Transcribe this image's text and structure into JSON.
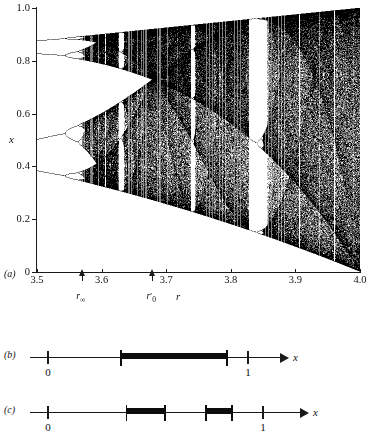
{
  "figure": {
    "panels": [
      {
        "tag": "(a)",
        "type": "bifurcation-diagram"
      },
      {
        "tag": "(b)",
        "type": "number-line"
      },
      {
        "tag": "(c)",
        "type": "number-line"
      }
    ]
  },
  "panel_a": {
    "tag": "(a)",
    "ylabel": "x",
    "xlabel": "r",
    "y_ticks": [
      "0",
      "0.2",
      "0.4",
      "0.6",
      "0.8",
      "1.0"
    ],
    "y_tick_values": [
      0,
      0.2,
      0.4,
      0.6,
      0.8,
      1.0
    ],
    "x_ticks": [
      "3.5",
      "3.6",
      "3.7",
      "3.8",
      "3.9",
      "4.0"
    ],
    "x_tick_values": [
      3.5,
      3.6,
      3.7,
      3.8,
      3.9,
      4.0
    ],
    "markers": [
      {
        "name": "r-infinity",
        "label_base": "r",
        "label_sub": "∞",
        "prime": false,
        "r": 3.5699
      },
      {
        "name": "r-zero-prime",
        "label_base": "r",
        "label_sub": "0",
        "prime": true,
        "r": 3.6786
      }
    ]
  },
  "panel_b": {
    "tag": "(b)",
    "axis_label": "x",
    "ticks": [
      {
        "label": "0",
        "value": 0.0
      },
      {
        "label": "1",
        "value": 1.0
      }
    ],
    "intervals": [
      {
        "start": 0.365,
        "end": 0.895
      }
    ]
  },
  "panel_c": {
    "tag": "(c)",
    "axis_label": "x",
    "ticks": [
      {
        "label": "0",
        "value": 0.0
      },
      {
        "label": "1",
        "value": 1.0
      }
    ],
    "intervals": [
      {
        "start": 0.365,
        "end": 0.545
      },
      {
        "start": 0.735,
        "end": 0.855
      }
    ]
  },
  "chart_data": {
    "type": "scatter",
    "title": "",
    "xlabel": "r",
    "ylabel": "x",
    "xlim": [
      3.5,
      4.0
    ],
    "ylim": [
      0.0,
      1.0
    ],
    "grid": false,
    "legend": "none",
    "map_formula": "x_{n+1} = r*x_n*(1-x_n)",
    "transient_iterations": 300,
    "plotted_iterations": 360,
    "r_samples": 646,
    "annotations": [
      {
        "text": "r∞",
        "r": 3.5699,
        "note": "accumulation point of period doubling"
      },
      {
        "text": "r'0",
        "r": 3.6786,
        "note": "band merging / onset of single chaotic band"
      }
    ],
    "notable_windows": [
      {
        "name": "period-3",
        "r_start": 3.828,
        "r_end": 3.857
      },
      {
        "name": "period-5",
        "r_start": 3.738,
        "r_end": 3.745
      },
      {
        "name": "period-6",
        "r_start": 3.626,
        "r_end": 3.635
      }
    ],
    "x_tick_values": [
      3.5,
      3.6,
      3.7,
      3.8,
      3.9,
      4.0
    ],
    "y_tick_values": [
      0,
      0.2,
      0.4,
      0.6,
      0.8,
      1.0
    ]
  }
}
